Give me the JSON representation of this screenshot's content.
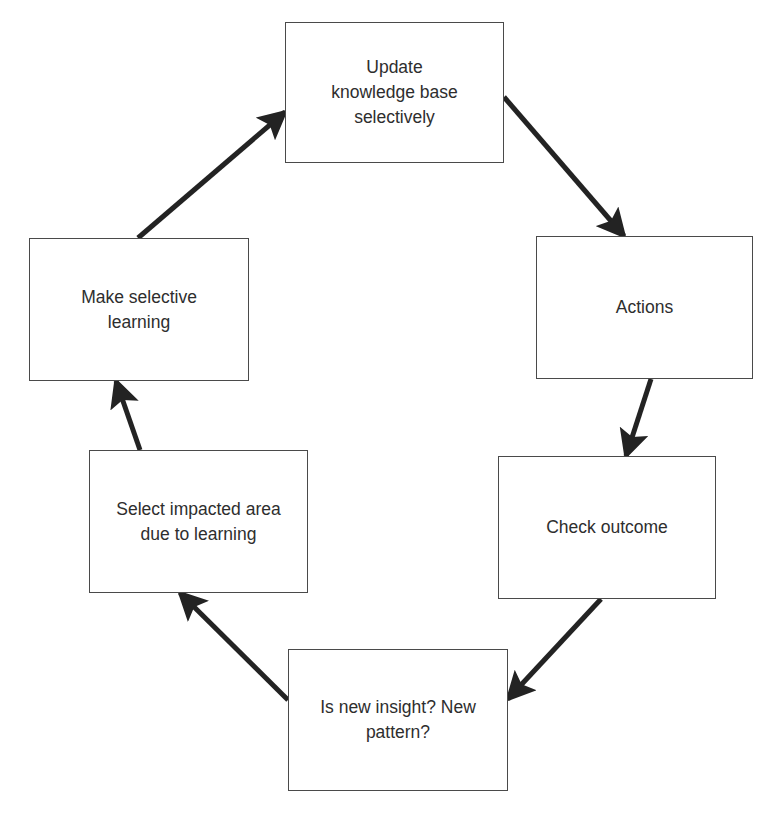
{
  "diagram": {
    "type": "cycle-flowchart",
    "colors": {
      "background": "#ffffff",
      "box_border": "#4a4a4a",
      "text": "#2e2e2e",
      "arrow": "#232323"
    },
    "nodes": [
      {
        "id": "update-kb",
        "label": "Update\nknowledge base\nselectively",
        "x": 285,
        "y": 22,
        "w": 219,
        "h": 141
      },
      {
        "id": "actions",
        "label": "Actions",
        "x": 536,
        "y": 236,
        "w": 217,
        "h": 143
      },
      {
        "id": "check-outcome",
        "label": "Check outcome",
        "x": 498,
        "y": 456,
        "w": 218,
        "h": 143
      },
      {
        "id": "new-insight",
        "label": "Is new insight? New\npattern?",
        "x": 288,
        "y": 649,
        "w": 220,
        "h": 142
      },
      {
        "id": "select-impacted",
        "label": "Select impacted area\ndue to learning",
        "x": 89,
        "y": 450,
        "w": 219,
        "h": 143
      },
      {
        "id": "selective-learning",
        "label": "Make selective\nlearning",
        "x": 29,
        "y": 238,
        "w": 220,
        "h": 143
      }
    ],
    "edges": [
      {
        "from": "update-kb",
        "to": "actions",
        "x1": 504,
        "y1": 97,
        "x2": 624,
        "y2": 236
      },
      {
        "from": "actions",
        "to": "check-outcome",
        "x1": 651,
        "y1": 379,
        "x2": 626,
        "y2": 456
      },
      {
        "from": "check-outcome",
        "to": "new-insight",
        "x1": 601,
        "y1": 599,
        "x2": 508,
        "y2": 699
      },
      {
        "from": "new-insight",
        "to": "select-impacted",
        "x1": 288,
        "y1": 700,
        "x2": 180,
        "y2": 593
      },
      {
        "from": "select-impacted",
        "to": "selective-learning",
        "x1": 140,
        "y1": 450,
        "x2": 116,
        "y2": 381
      },
      {
        "from": "selective-learning",
        "to": "update-kb",
        "x1": 138,
        "y1": 238,
        "x2": 285,
        "y2": 112
      }
    ]
  }
}
